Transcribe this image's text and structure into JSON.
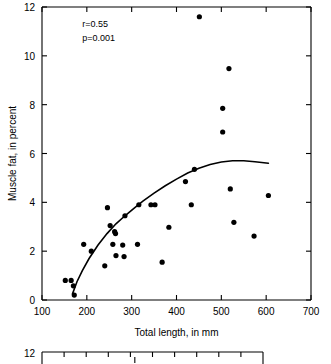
{
  "figure": {
    "title": "",
    "annotations": [
      "r=0.55",
      "p=0.001"
    ]
  },
  "chart_data": {
    "type": "scatter",
    "title": "",
    "xlabel": "Total length, in mm",
    "ylabel": "Muscle fat, in percent",
    "xlim": [
      100,
      700
    ],
    "ylim": [
      0,
      12
    ],
    "xticks": [
      100,
      200,
      300,
      400,
      500,
      600,
      700
    ],
    "xtick_labels": [
      "100",
      "200",
      "300",
      "400",
      "500",
      "600",
      "700"
    ],
    "yticks": [
      0,
      2,
      4,
      6,
      8,
      10,
      12
    ],
    "ytick_labels": [
      "0",
      "2",
      "4",
      "6",
      "8",
      "10",
      "12"
    ],
    "grid": false,
    "legend": null,
    "annotations": [
      {
        "text": "r=0.55",
        "x": 190,
        "y": 11.2
      },
      {
        "text": "p=0.001",
        "x": 190,
        "y": 10.6
      }
    ],
    "points": [
      {
        "x": 152,
        "y": 0.8
      },
      {
        "x": 165,
        "y": 0.8
      },
      {
        "x": 170,
        "y": 0.58
      },
      {
        "x": 172,
        "y": 0.2
      },
      {
        "x": 193,
        "y": 2.28
      },
      {
        "x": 210,
        "y": 2.0
      },
      {
        "x": 240,
        "y": 1.4
      },
      {
        "x": 246,
        "y": 3.78
      },
      {
        "x": 252,
        "y": 3.05
      },
      {
        "x": 258,
        "y": 2.28
      },
      {
        "x": 262,
        "y": 2.8
      },
      {
        "x": 264,
        "y": 2.72
      },
      {
        "x": 265,
        "y": 1.82
      },
      {
        "x": 280,
        "y": 2.25
      },
      {
        "x": 283,
        "y": 1.78
      },
      {
        "x": 285,
        "y": 3.45
      },
      {
        "x": 313,
        "y": 2.28
      },
      {
        "x": 316,
        "y": 3.9
      },
      {
        "x": 343,
        "y": 3.9
      },
      {
        "x": 352,
        "y": 3.9
      },
      {
        "x": 368,
        "y": 1.55
      },
      {
        "x": 383,
        "y": 2.98
      },
      {
        "x": 420,
        "y": 4.85
      },
      {
        "x": 433,
        "y": 3.9
      },
      {
        "x": 440,
        "y": 5.35
      },
      {
        "x": 451,
        "y": 11.6
      },
      {
        "x": 503,
        "y": 7.85
      },
      {
        "x": 503,
        "y": 6.88
      },
      {
        "x": 517,
        "y": 9.48
      },
      {
        "x": 520,
        "y": 4.55
      },
      {
        "x": 528,
        "y": 3.18
      },
      {
        "x": 573,
        "y": 2.62
      },
      {
        "x": 605,
        "y": 4.28
      }
    ],
    "fit_curve": {
      "name": "fitted-regression-curve",
      "points": [
        {
          "x": 168,
          "y": 0.25
        },
        {
          "x": 178,
          "y": 0.75
        },
        {
          "x": 190,
          "y": 1.2
        },
        {
          "x": 205,
          "y": 1.7
        },
        {
          "x": 225,
          "y": 2.25
        },
        {
          "x": 245,
          "y": 2.72
        },
        {
          "x": 265,
          "y": 3.12
        },
        {
          "x": 285,
          "y": 3.45
        },
        {
          "x": 305,
          "y": 3.75
        },
        {
          "x": 325,
          "y": 4.05
        },
        {
          "x": 350,
          "y": 4.38
        },
        {
          "x": 375,
          "y": 4.68
        },
        {
          "x": 400,
          "y": 4.95
        },
        {
          "x": 425,
          "y": 5.2
        },
        {
          "x": 450,
          "y": 5.4
        },
        {
          "x": 475,
          "y": 5.55
        },
        {
          "x": 500,
          "y": 5.65
        },
        {
          "x": 525,
          "y": 5.7
        },
        {
          "x": 550,
          "y": 5.7
        },
        {
          "x": 575,
          "y": 5.66
        },
        {
          "x": 605,
          "y": 5.6
        }
      ]
    }
  },
  "second_chart_partial": {
    "ytick_label_top": "12",
    "visible": true
  }
}
